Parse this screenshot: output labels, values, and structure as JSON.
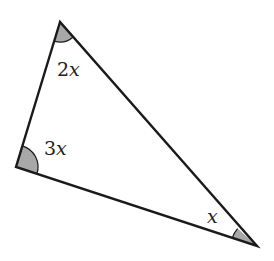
{
  "diagram": {
    "type": "triangle",
    "stroke_color": "#1a1a1a",
    "fill_color": "#a8a8a8",
    "vertices": {
      "top": {
        "x": 60,
        "y": 22
      },
      "left": {
        "x": 16,
        "y": 167
      },
      "right": {
        "x": 257,
        "y": 246
      }
    },
    "angles": [
      {
        "vertex": "top",
        "coef": "2",
        "var": "x",
        "label": "2x"
      },
      {
        "vertex": "left",
        "coef": "3",
        "var": "x",
        "label": "3x"
      },
      {
        "vertex": "right",
        "coef": "",
        "var": "x",
        "label": "x"
      }
    ]
  }
}
